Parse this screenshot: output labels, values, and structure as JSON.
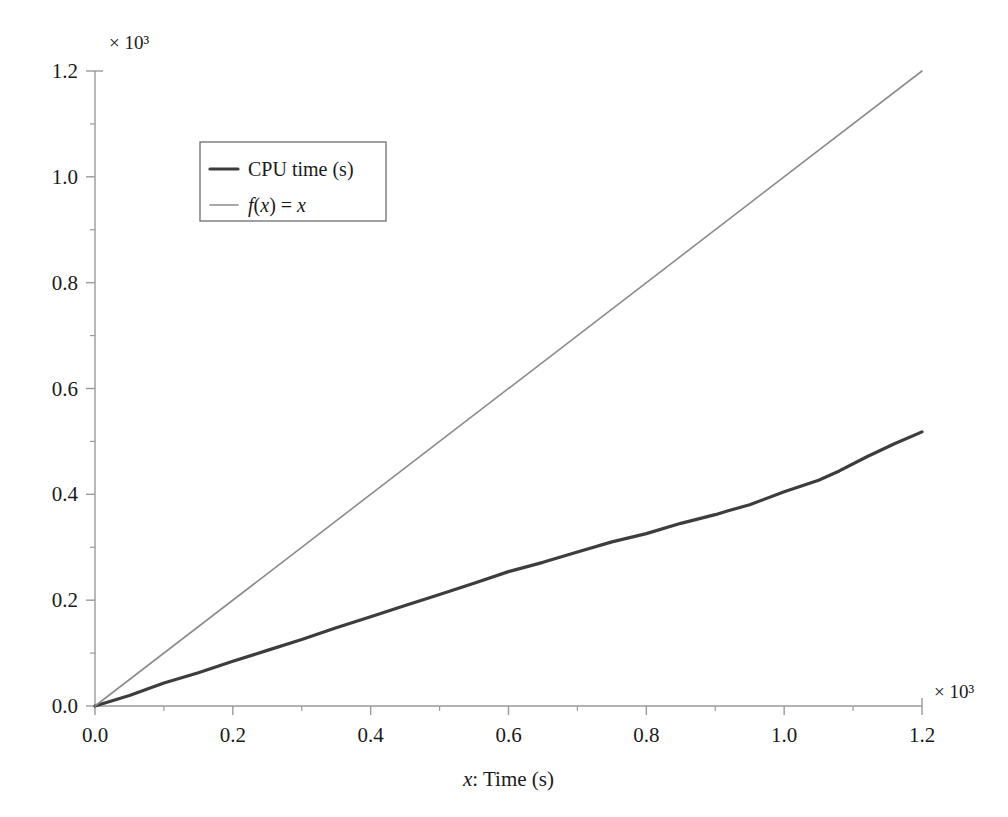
{
  "chart_data": {
    "type": "line",
    "title": "",
    "xlabel": "x: Time (s)",
    "ylabel": "",
    "x_multiplier": "× 10³",
    "y_multiplier": "× 10³",
    "xlim": [
      0.0,
      1.2
    ],
    "ylim": [
      0.0,
      1.2
    ],
    "x_ticks": [
      "0.0",
      "0.2",
      "0.4",
      "0.6",
      "0.8",
      "1.0",
      "1.2"
    ],
    "x_tick_values": [
      0.0,
      0.2,
      0.4,
      0.6,
      0.8,
      1.0,
      1.2
    ],
    "y_ticks": [
      "0.0",
      "0.2",
      "0.4",
      "0.6",
      "0.8",
      "1.0",
      "1.2"
    ],
    "y_tick_values": [
      0.0,
      0.2,
      0.4,
      0.6,
      0.8,
      1.0,
      1.2
    ],
    "x_minor_ticks": [
      0.1,
      0.3,
      0.5,
      0.7,
      0.9,
      1.1
    ],
    "y_minor_ticks": [
      0.1,
      0.3,
      0.5,
      0.7,
      0.9,
      1.1
    ],
    "grid": false,
    "legend_position": "upper-left-inset",
    "series": [
      {
        "name": "CPU time (s)",
        "color": "#3d3d3d",
        "width": 3.2,
        "x": [
          0.0,
          0.05,
          0.1,
          0.15,
          0.2,
          0.25,
          0.3,
          0.35,
          0.4,
          0.45,
          0.5,
          0.55,
          0.6,
          0.65,
          0.7,
          0.75,
          0.8,
          0.85,
          0.9,
          0.92,
          0.95,
          1.0,
          1.05,
          1.08,
          1.12,
          1.16,
          1.2
        ],
        "y": [
          0.0,
          0.021,
          0.042,
          0.063,
          0.084,
          0.105,
          0.126,
          0.147,
          0.168,
          0.19,
          0.212,
          0.233,
          0.253,
          0.273,
          0.292,
          0.31,
          0.327,
          0.345,
          0.362,
          0.369,
          0.381,
          0.405,
          0.427,
          0.444,
          0.47,
          0.495,
          0.518
        ]
      },
      {
        "name": "f(x) = x",
        "color": "#8c8c8c",
        "width": 1.6,
        "x": [
          0.0,
          1.2
        ],
        "y": [
          0.0,
          1.2
        ]
      }
    ]
  },
  "legend": {
    "entries": [
      {
        "label": "CPU time (s)",
        "swatch_color": "#3d3d3d",
        "swatch_width": 3.2
      },
      {
        "label": "f(x) = x",
        "swatch_color": "#8c8c8c",
        "swatch_width": 1.6
      }
    ]
  },
  "axis_text": {
    "x_label_prefix": "x",
    "x_label_suffix": ": Time (s)",
    "x_exponent": "× 10³",
    "y_exponent": "× 10³"
  },
  "style": {
    "background": "#ffffff",
    "axis_color": "#9a9a9a",
    "text_color": "#1a1a1a",
    "legend_border": "#6e6e6e",
    "data_color": "#3d3d3d",
    "reference_color": "#8c8c8c"
  }
}
